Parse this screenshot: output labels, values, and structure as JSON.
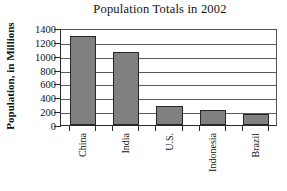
{
  "chart_data": {
    "type": "bar",
    "title": "Population Totals in 2002",
    "xlabel": "",
    "ylabel": "Population, in Millions",
    "categories": [
      "China",
      "India",
      "U.S.",
      "Indonesia",
      "Brazil"
    ],
    "values": [
      1280,
      1050,
      275,
      210,
      165
    ],
    "ylim": [
      0,
      1400
    ],
    "yticks": [
      0,
      200,
      400,
      600,
      800,
      1000,
      1200,
      1400
    ],
    "ytick_labels": [
      "0",
      "200",
      "400",
      "600",
      "800",
      "1000",
      "1200",
      "1400"
    ],
    "grid": true,
    "legend": false,
    "bar_color": "#808080",
    "bar_edge_color": "#262626",
    "axis_color": "#2b2b2b",
    "background": "#ffffff"
  }
}
